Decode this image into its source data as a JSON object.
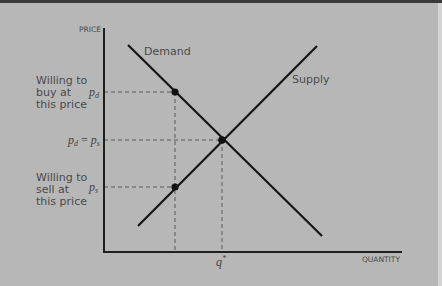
{
  "diagram": {
    "axes": {
      "y_label": "PRICE",
      "x_label": "QUANTITY"
    },
    "curves": {
      "demand_label": "Demand",
      "supply_label": "Supply"
    },
    "price_labels": {
      "pd": "p",
      "pd_sub": "d",
      "eq_left": "p",
      "eq_left_sub": "d",
      "eq_eq": " = ",
      "eq_right": "p",
      "eq_right_sub": "s",
      "ps": "p",
      "ps_sub": "s"
    },
    "quantity_label": "q",
    "quantity_sup": "*",
    "annotations": {
      "buy": [
        "Willing to",
        "buy at",
        "this price"
      ],
      "sell": [
        "Willing to",
        "sell at",
        "this price"
      ]
    },
    "colors": {
      "background": "#b7b7b7",
      "line": "#1a1a1a",
      "dashed": "#555555",
      "text": "#444444"
    }
  }
}
